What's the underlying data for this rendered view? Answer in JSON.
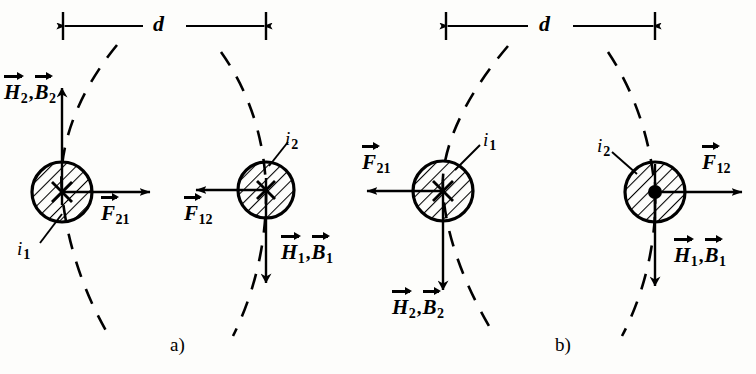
{
  "figure": {
    "type": "physics-diagram",
    "width": 756,
    "height": 374,
    "background_color": "#fdfdfb",
    "ink_color": "#000000"
  },
  "panels": [
    {
      "id": "a",
      "caption": "a)",
      "caption_x": 175,
      "caption_y": 344,
      "distance_label": "d",
      "conductors": [
        {
          "id": "a-left",
          "current_label": "i",
          "current_sub": "1",
          "current_direction": "into-page",
          "marker": "cross",
          "center_x": 62,
          "center_y": 192,
          "radius": 30
        },
        {
          "id": "a-right",
          "current_label": "i",
          "current_sub": "2",
          "current_direction": "into-page",
          "marker": "cross",
          "center_x": 266,
          "center_y": 190,
          "radius": 28
        }
      ],
      "field_labels": [
        {
          "id": "a-field-left",
          "symbols": [
            "H",
            "B"
          ],
          "subs": [
            "2",
            "2"
          ],
          "arrow_direction": "up"
        },
        {
          "id": "a-field-right",
          "symbols": [
            "H",
            "B"
          ],
          "subs": [
            "1",
            "1"
          ],
          "arrow_direction": "down"
        }
      ],
      "force_labels": [
        {
          "id": "a-force-21",
          "symbol": "F",
          "sub": "21",
          "arrow_direction": "right"
        },
        {
          "id": "a-force-12",
          "symbol": "F",
          "sub": "12",
          "arrow_direction": "left"
        }
      ],
      "interaction": "attraction"
    },
    {
      "id": "b",
      "caption": "b)",
      "caption_x": 560,
      "caption_y": 344,
      "distance_label": "d",
      "conductors": [
        {
          "id": "b-left",
          "current_label": "i",
          "current_sub": "1",
          "current_direction": "into-page",
          "marker": "cross",
          "center_x": 443,
          "center_y": 191,
          "radius": 30
        },
        {
          "id": "b-right",
          "current_label": "i",
          "current_sub": "2",
          "current_direction": "out-of-page",
          "marker": "dot",
          "center_x": 655,
          "center_y": 192,
          "radius": 30
        }
      ],
      "field_labels": [
        {
          "id": "b-field-left",
          "symbols": [
            "H",
            "B"
          ],
          "subs": [
            "2",
            "2"
          ],
          "arrow_direction": "down"
        },
        {
          "id": "b-field-right",
          "symbols": [
            "H",
            "B"
          ],
          "subs": [
            "1",
            "1"
          ],
          "arrow_direction": "down"
        }
      ],
      "force_labels": [
        {
          "id": "b-force-21",
          "symbol": "F",
          "sub": "21",
          "arrow_direction": "left"
        },
        {
          "id": "b-force-12",
          "symbol": "F",
          "sub": "12",
          "arrow_direction": "right"
        }
      ],
      "interaction": "repulsion"
    }
  ],
  "labels": {
    "d_a": "d",
    "d_b": "d",
    "caption_a": "a)",
    "caption_b": "b)",
    "H": "H",
    "B": "B",
    "F": "F",
    "i": "i",
    "comma": ",",
    "sub_1": "1",
    "sub_2": "2",
    "sub_12": "12",
    "sub_21": "21"
  }
}
